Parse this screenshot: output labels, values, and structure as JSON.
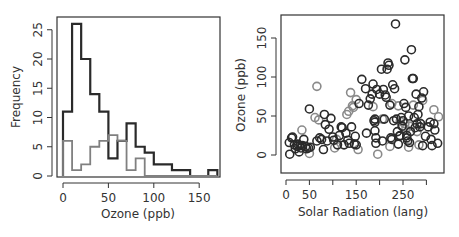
{
  "chart_data": [
    {
      "type": "histogram",
      "panel": "left",
      "title": "",
      "xlabel": "Ozone (ppb)",
      "ylabel": "Frequency",
      "xlim": [
        0,
        170
      ],
      "ylim": [
        0,
        28
      ],
      "xticks": [
        0,
        50,
        100,
        150
      ],
      "yticks": [
        0,
        5,
        10,
        15,
        20,
        25
      ],
      "bin_width": 10,
      "bin_edges": [
        0,
        10,
        20,
        30,
        40,
        50,
        60,
        70,
        80,
        90,
        100,
        110,
        120,
        130,
        140,
        150,
        160,
        170
      ],
      "series": [
        {
          "name": "dark",
          "color": "#2a2a2a",
          "values": [
            11,
            26,
            20,
            14,
            11,
            3,
            6,
            9,
            5,
            4,
            2,
            2,
            1,
            1,
            0,
            0,
            1
          ]
        },
        {
          "name": "gray",
          "color": "#808080",
          "values": [
            6,
            1,
            2,
            5,
            6,
            7,
            6,
            1,
            3,
            0,
            0,
            0,
            0,
            0,
            0,
            0,
            0
          ]
        }
      ],
      "grid": false,
      "legend": null
    },
    {
      "type": "scatter",
      "panel": "right",
      "title": "",
      "xlabel": "Solar Radiation (lang)",
      "ylabel": "Ozone (ppb)",
      "xlim": [
        0,
        340
      ],
      "ylim": [
        -20,
        175
      ],
      "xticks": [
        0,
        50,
        100,
        150,
        200,
        250,
        300
      ],
      "xtick_labels": [
        "0",
        "50",
        "",
        "150",
        "",
        "250",
        ""
      ],
      "yticks": [
        0,
        50,
        100,
        150
      ],
      "grid": false,
      "legend": null,
      "series": [
        {
          "name": "dark",
          "color": "#2a2a2a",
          "points": [
            [
              8,
              1
            ],
            [
              7,
              16
            ],
            [
              12,
              22
            ],
            [
              14,
              23
            ],
            [
              18,
              13
            ],
            [
              20,
              8
            ],
            [
              24,
              11
            ],
            [
              25,
              14
            ],
            [
              28,
              4
            ],
            [
              30,
              12
            ],
            [
              32,
              9
            ],
            [
              35,
              12
            ],
            [
              38,
              20
            ],
            [
              42,
              11
            ],
            [
              44,
              8
            ],
            [
              48,
              9
            ],
            [
              50,
              59
            ],
            [
              52,
              10
            ],
            [
              66,
              18
            ],
            [
              72,
              22
            ],
            [
              76,
              20
            ],
            [
              80,
              7
            ],
            [
              82,
              52
            ],
            [
              84,
              39
            ],
            [
              88,
              18
            ],
            [
              92,
              33
            ],
            [
              96,
              47
            ],
            [
              100,
              23
            ],
            [
              102,
              19
            ],
            [
              110,
              13
            ],
            [
              114,
              25
            ],
            [
              118,
              36
            ],
            [
              120,
              35
            ],
            [
              124,
              13
            ],
            [
              128,
              28
            ],
            [
              132,
              19
            ],
            [
              135,
              15
            ],
            [
              140,
              36
            ],
            [
              146,
              14
            ],
            [
              148,
              24
            ],
            [
              150,
              13
            ],
            [
              156,
              66
            ],
            [
              162,
              97
            ],
            [
              170,
              85
            ],
            [
              172,
              28
            ],
            [
              176,
              64
            ],
            [
              180,
              72
            ],
            [
              184,
              78
            ],
            [
              186,
              91
            ],
            [
              188,
              44
            ],
            [
              190,
              46
            ],
            [
              190,
              42
            ],
            [
              190,
              31
            ],
            [
              192,
              22
            ],
            [
              192,
              15
            ],
            [
              194,
              84
            ],
            [
              200,
              78
            ],
            [
              204,
              110
            ],
            [
              206,
              18
            ],
            [
              208,
              84
            ],
            [
              210,
              46
            ],
            [
              212,
              77
            ],
            [
              214,
              74
            ],
            [
              216,
              110
            ],
            [
              218,
              118
            ],
            [
              220,
              115
            ],
            [
              222,
              64
            ],
            [
              224,
              22
            ],
            [
              226,
              20
            ],
            [
              228,
              90
            ],
            [
              230,
              44
            ],
            [
              232,
              85
            ],
            [
              234,
              168
            ],
            [
              236,
              46
            ],
            [
              238,
              30
            ],
            [
              240,
              14
            ],
            [
              242,
              24
            ],
            [
              244,
              25
            ],
            [
              246,
              48
            ],
            [
              248,
              37
            ],
            [
              250,
              44
            ],
            [
              252,
              66
            ],
            [
              254,
              122
            ],
            [
              256,
              61
            ],
            [
              258,
              22
            ],
            [
              258,
              25
            ],
            [
              260,
              18
            ],
            [
              262,
              50
            ],
            [
              264,
              16
            ],
            [
              266,
              30
            ],
            [
              268,
              135
            ],
            [
              270,
              98
            ],
            [
              272,
              98
            ],
            [
              274,
              48
            ],
            [
              276,
              35
            ],
            [
              278,
              78
            ],
            [
              280,
              40
            ],
            [
              282,
              52
            ],
            [
              284,
              62
            ],
            [
              286,
              36
            ],
            [
              288,
              40
            ],
            [
              290,
              73
            ],
            [
              292,
              12
            ],
            [
              294,
              81
            ],
            [
              298,
              24
            ],
            [
              304,
              36
            ],
            [
              308,
              42
            ],
            [
              310,
              20
            ],
            [
              312,
              12
            ],
            [
              316,
              40
            ],
            [
              318,
              32
            ],
            [
              324,
              15
            ]
          ]
        },
        {
          "name": "gray",
          "color": "#8a8a8a",
          "points": [
            [
              34,
              32
            ],
            [
              50,
              2
            ],
            [
              66,
              88
            ],
            [
              62,
              48
            ],
            [
              70,
              45
            ],
            [
              108,
              20
            ],
            [
              104,
              9
            ],
            [
              130,
              52
            ],
            [
              134,
              56
            ],
            [
              138,
              80
            ],
            [
              142,
              63
            ],
            [
              144,
              61
            ],
            [
              150,
              71
            ],
            [
              154,
              7
            ],
            [
              186,
              62
            ],
            [
              196,
              1
            ],
            [
              206,
              46
            ],
            [
              222,
              11
            ],
            [
              226,
              66
            ],
            [
              240,
              63
            ],
            [
              244,
              43
            ],
            [
              250,
              36
            ],
            [
              254,
              40
            ],
            [
              256,
              33
            ],
            [
              262,
              10
            ],
            [
              264,
              37
            ],
            [
              272,
              64
            ],
            [
              280,
              30
            ],
            [
              284,
              13
            ],
            [
              286,
              41
            ],
            [
              292,
              70
            ],
            [
              316,
              58
            ],
            [
              326,
              49
            ]
          ]
        }
      ]
    }
  ]
}
